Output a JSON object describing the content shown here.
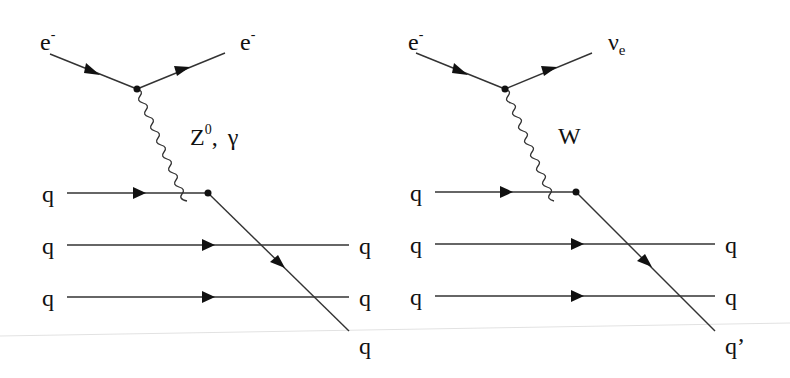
{
  "diagrams": [
    {
      "name": "neutral-current",
      "incoming_lepton": {
        "label": "e",
        "sup": "-"
      },
      "outgoing_lepton": {
        "label": "e",
        "sup": "-"
      },
      "boson": {
        "label": "Z",
        "sup": "0",
        "sep": ",",
        "alt": "γ"
      },
      "quarks_in": [
        "q",
        "q",
        "q"
      ],
      "quarks_out": [
        "q",
        "q",
        "q"
      ]
    },
    {
      "name": "charged-current",
      "incoming_lepton": {
        "label": "e",
        "sup": "-"
      },
      "outgoing_lepton": {
        "label": "ν",
        "sub": "e"
      },
      "boson": {
        "label": "W"
      },
      "quarks_in": [
        "q",
        "q",
        "q"
      ],
      "quarks_out": [
        "q",
        "q",
        "q’"
      ]
    }
  ]
}
